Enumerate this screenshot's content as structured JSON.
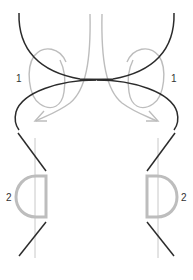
{
  "diagram": {
    "type": "strand-crossing-illustration",
    "labels": {
      "step1_left": "1",
      "step1_right": "1",
      "step2_left": "2",
      "step2_right": "2"
    },
    "colors": {
      "dark_strand": "#2b2b2b",
      "light_strand": "#bdbdbd",
      "guide_line": "#c8c8c8",
      "label": "#333333",
      "background": "#ffffff"
    },
    "panels": [
      {
        "name": "top",
        "description": "Two dark strands cross at center; light curved arrows labeled 1 loop outward"
      },
      {
        "name": "bottom",
        "description": "Dark diagonal strands with light D-shaped loops labeled 2 on each side"
      }
    ]
  }
}
